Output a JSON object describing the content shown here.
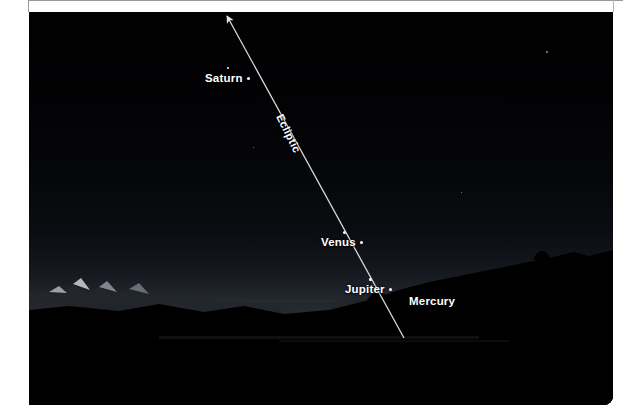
{
  "figure": {
    "kind": "astronomy-photograph",
    "scene": "twilight sky over mountain ridge with planetary alignment",
    "frame_width": 623,
    "frame_height": 417
  },
  "annotations": {
    "ecliptic_label": "Ecliptic",
    "planets": [
      {
        "name": "Saturn",
        "label": "Saturn",
        "marker": "•",
        "x": 176,
        "y": 60
      },
      {
        "name": "Venus",
        "label": "Venus",
        "marker": "•",
        "x": 292,
        "y": 224
      },
      {
        "name": "Jupiter",
        "label": "Jupiter",
        "marker": "•",
        "x": 316,
        "y": 271
      },
      {
        "name": "Mercury",
        "label": "Mercury",
        "marker": "",
        "x": 380,
        "y": 283
      }
    ]
  },
  "colors": {
    "label_text": "#ffffff",
    "ecliptic_line": "#d8d8d8",
    "sky_dark": "#010102",
    "twilight_glow": "#ffffff",
    "terrain_silhouette": "#000000",
    "page_background": "#ffffff",
    "frame_rule": "#9a9a9a"
  }
}
